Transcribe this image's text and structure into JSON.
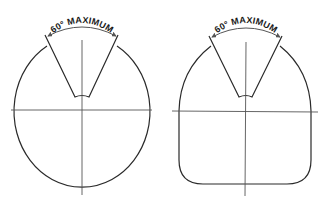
{
  "diagrams": [
    {
      "shape": "ellipse",
      "angle_label": "60° MAXIMUM"
    },
    {
      "shape": "rounded-rectangle",
      "angle_label": "60° MAXIMUM"
    }
  ],
  "colors": {
    "outline": "#2a2a2a",
    "axis": "#555555",
    "background": "#ffffff"
  }
}
